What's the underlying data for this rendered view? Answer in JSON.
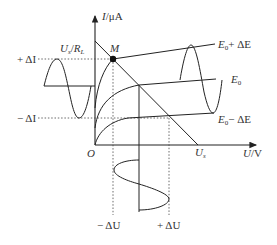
{
  "figure": {
    "type": "IV characteristic diagram",
    "y_axis_label": "I/μA",
    "x_axis_label": "U/V",
    "origin_label": "O",
    "point_label": "M",
    "intercept_y_label": "U_s/R_L",
    "intercept_x_label": "U_s",
    "curve_labels": [
      "E_0 + ΔE",
      "E_0",
      "E_0 − ΔE"
    ],
    "current_swing_labels": [
      "+ ΔI",
      "− ΔI"
    ],
    "voltage_swing_labels": [
      "− ΔU",
      "+ ΔU"
    ]
  },
  "labels": {
    "y_axis_I": "I",
    "y_axis_unit": "/μA",
    "x_axis_U": "U",
    "x_axis_unit": "/V",
    "origin": "O",
    "M": "M",
    "Us_over_RL_U": "U",
    "Us_over_RL_s": "s",
    "Us_over_RL_slash": "/",
    "Us_over_RL_R": "R",
    "Us_over_RL_L": "L",
    "Us_U": "U",
    "Us_s": "s",
    "plus_dI": "+ ΔI",
    "minus_dI": "− ΔI",
    "E_plus_E": "E",
    "E_plus_0": "0",
    "E_plus_rest": "+ ΔE",
    "E0_E": "E",
    "E0_0": "0",
    "E_minus_E": "E",
    "E_minus_0": "0",
    "E_minus_rest": "− ΔE",
    "minus_dU": "− ΔU",
    "plus_dU": "+ ΔU"
  }
}
